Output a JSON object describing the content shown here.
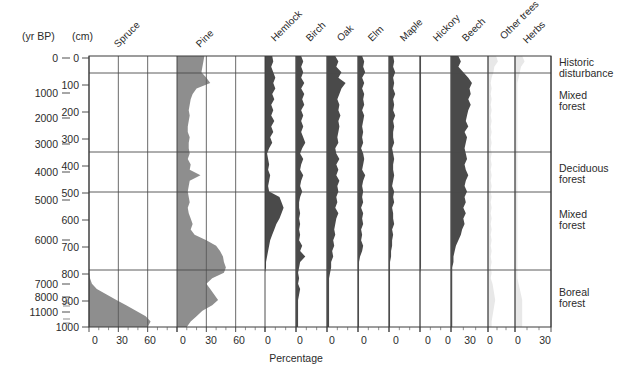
{
  "figure": {
    "axis_unit_labels": {
      "left": "(yr BP)",
      "depth": "(cm)"
    },
    "x_axis_title": "Percentage",
    "colors": {
      "curve_dark": "#4a4a4a",
      "curve_mid": "#8e8e8e",
      "curve_light": "#e8e8e8",
      "axis": "#3a3a3a",
      "zone_line": "#4a4a4a",
      "background": "#ffffff"
    },
    "plot_box": {
      "left": 89,
      "right": 551,
      "top": 56,
      "bottom": 327
    }
  },
  "age_axis": {
    "label": "(yr BP)",
    "ticks": [
      {
        "value": "0",
        "y": 58
      },
      {
        "value": "1000",
        "y": 93
      },
      {
        "value": "2000",
        "y": 118
      },
      {
        "value": "3000",
        "y": 144
      },
      {
        "value": "4000",
        "y": 172
      },
      {
        "value": "5000",
        "y": 200
      },
      {
        "value": "6000",
        "y": 240
      },
      {
        "value": "7000",
        "y": 284
      },
      {
        "value": "8000",
        "y": 297
      },
      {
        "value": "11000",
        "y": 312
      }
    ],
    "minor_ticks_y": [
      303,
      306,
      319,
      323
    ]
  },
  "depth_axis": {
    "label": "(cm)",
    "ticks": [
      {
        "value": "0",
        "y": 58
      },
      {
        "value": "100",
        "y": 85
      },
      {
        "value": "200",
        "y": 112
      },
      {
        "value": "300",
        "y": 139
      },
      {
        "value": "400",
        "y": 166
      },
      {
        "value": "500",
        "y": 193
      },
      {
        "value": "600",
        "y": 220
      },
      {
        "value": "700",
        "y": 247
      },
      {
        "value": "800",
        "y": 274
      },
      {
        "value": "900",
        "y": 301
      },
      {
        "value": "1000",
        "y": 327
      }
    ],
    "range_cm": [
      0,
      1000
    ]
  },
  "zones": [
    {
      "label_line1": "Historic",
      "label_line2": "disturbance",
      "top_y": 56,
      "bottom_y": 73,
      "depth_top_cm": 0,
      "depth_bottom_cm": 63
    },
    {
      "label_line1": "Mixed",
      "label_line2": "forest",
      "top_y": 73,
      "bottom_y": 152,
      "depth_top_cm": 63,
      "depth_bottom_cm": 353
    },
    {
      "label_line1": "Deciduous",
      "label_line2": "forest",
      "top_y": 152,
      "bottom_y": 192,
      "depth_top_cm": 353,
      "depth_bottom_cm": 500
    },
    {
      "label_line1": "Mixed",
      "label_line2": "forest",
      "top_y": 192,
      "bottom_y": 270,
      "depth_top_cm": 500,
      "depth_bottom_cm": 790
    },
    {
      "label_line1": "Boreal",
      "label_line2": "forest",
      "top_y": 270,
      "bottom_y": 327,
      "depth_top_cm": 790,
      "depth_bottom_cm": 1000
    }
  ],
  "taxa": [
    {
      "name": "Spruce",
      "x_ticks": [
        "0",
        "30",
        "60"
      ],
      "max_pct": 90,
      "shade": "mid",
      "label_x": 118,
      "label_y": 48
    },
    {
      "name": "Pine",
      "x_ticks": [
        "0",
        "30",
        "60"
      ],
      "max_pct": 90,
      "shade": "mid",
      "label_x": 200,
      "label_y": 48
    },
    {
      "name": "Hemlock",
      "x_ticks": [
        "0"
      ],
      "max_pct": 30,
      "shade": "dark",
      "label_x": 275,
      "label_y": 42
    },
    {
      "name": "Birch",
      "x_ticks": [
        "0"
      ],
      "max_pct": 30,
      "shade": "dark",
      "label_x": 310,
      "label_y": 42
    },
    {
      "name": "Oak",
      "x_ticks": [
        "0"
      ],
      "max_pct": 30,
      "shade": "dark",
      "label_x": 341,
      "label_y": 42
    },
    {
      "name": "Elm",
      "x_ticks": [
        "0"
      ],
      "max_pct": 30,
      "shade": "dark",
      "label_x": 372,
      "label_y": 42
    },
    {
      "name": "Maple",
      "x_ticks": [
        "0"
      ],
      "max_pct": 30,
      "shade": "dark",
      "label_x": 404,
      "label_y": 42
    },
    {
      "name": "Hickory",
      "x_ticks": [
        "0"
      ],
      "max_pct": 30,
      "shade": "dark",
      "label_x": 437,
      "label_y": 42
    },
    {
      "name": "Beech",
      "x_ticks": [
        "0",
        "30"
      ],
      "max_pct": 30,
      "shade": "dark",
      "label_x": 466,
      "label_y": 42
    },
    {
      "name": "Other trees",
      "x_ticks": [
        "0"
      ],
      "max_pct": 30,
      "shade": "light",
      "label_x": 504,
      "label_y": 40
    },
    {
      "name": "Herbs",
      "x_ticks": [
        "0",
        "30"
      ],
      "max_pct": 30,
      "shade": "light",
      "label_x": 527,
      "label_y": 44
    }
  ],
  "chart_data": {
    "type": "area",
    "xlabel": "Percentage",
    "ylabel": "(cm)",
    "secondary_ylabel": "(yr BP)",
    "ylim_depth_cm": [
      0,
      1000
    ],
    "y_inverted": true,
    "grid": "zone-boundaries-only",
    "legend": "none (taxon names as rotated column headers)",
    "annotations": [
      "Historic disturbance",
      "Mixed forest",
      "Deciduous forest",
      "Mixed forest",
      "Boreal forest"
    ],
    "depths_cm": [
      0,
      20,
      40,
      60,
      80,
      100,
      120,
      140,
      160,
      180,
      200,
      220,
      240,
      260,
      280,
      300,
      320,
      340,
      360,
      380,
      400,
      420,
      440,
      460,
      480,
      500,
      520,
      540,
      560,
      580,
      600,
      620,
      640,
      660,
      680,
      700,
      720,
      740,
      760,
      780,
      800,
      820,
      840,
      860,
      880,
      900,
      920,
      940,
      960,
      980,
      1000
    ],
    "series": [
      {
        "name": "Spruce",
        "xmax_pct": 90,
        "shade": "mid",
        "values": [
          0,
          0,
          0,
          0,
          0,
          0,
          0,
          0,
          0,
          0,
          0,
          0,
          0,
          0,
          0,
          0,
          0,
          0,
          0,
          0,
          0,
          0,
          0,
          0,
          0,
          0,
          0,
          0,
          0,
          0,
          0,
          0,
          0,
          0,
          0,
          0,
          0,
          0,
          0,
          0,
          0,
          1,
          3,
          8,
          18,
          28,
          38,
          48,
          58,
          63,
          60
        ]
      },
      {
        "name": "Pine",
        "xmax_pct": 90,
        "shade": "mid",
        "values": [
          28,
          27,
          26,
          25,
          30,
          34,
          20,
          16,
          14,
          13,
          12,
          13,
          12,
          11,
          11,
          13,
          12,
          12,
          13,
          11,
          14,
          13,
          24,
          13,
          12,
          11,
          12,
          13,
          11,
          12,
          14,
          16,
          14,
          18,
          30,
          40,
          44,
          47,
          48,
          50,
          48,
          36,
          30,
          34,
          38,
          42,
          36,
          26,
          20,
          14,
          10
        ]
      },
      {
        "name": "Hemlock",
        "xmax_pct": 30,
        "shade": "dark",
        "values": [
          7,
          8,
          6,
          8,
          10,
          8,
          10,
          7,
          9,
          6,
          8,
          6,
          9,
          6,
          8,
          5,
          7,
          4,
          2,
          3,
          4,
          3,
          5,
          4,
          3,
          4,
          14,
          16,
          18,
          16,
          14,
          11,
          9,
          7,
          5,
          4,
          3,
          2,
          1,
          1,
          0,
          0,
          0,
          0,
          0,
          0,
          0,
          0,
          0,
          0,
          0
        ]
      },
      {
        "name": "Birch",
        "xmax_pct": 30,
        "shade": "dark",
        "values": [
          5,
          7,
          5,
          7,
          5,
          8,
          5,
          8,
          6,
          8,
          5,
          7,
          5,
          7,
          5,
          7,
          9,
          6,
          4,
          7,
          5,
          4,
          7,
          5,
          4,
          6,
          4,
          3,
          3,
          4,
          3,
          4,
          3,
          4,
          3,
          6,
          4,
          9,
          4,
          3,
          2,
          3,
          2,
          4,
          3,
          2,
          2,
          2,
          2,
          2,
          2
        ]
      },
      {
        "name": "Oak",
        "xmax_pct": 30,
        "shade": "dark",
        "values": [
          8,
          11,
          9,
          14,
          11,
          18,
          14,
          12,
          10,
          12,
          11,
          13,
          11,
          12,
          11,
          10,
          11,
          8,
          9,
          12,
          9,
          11,
          9,
          12,
          10,
          11,
          9,
          10,
          8,
          11,
          9,
          8,
          7,
          8,
          6,
          7,
          5,
          6,
          4,
          4,
          3,
          2,
          2,
          2,
          2,
          2,
          2,
          2,
          2,
          2,
          2
        ]
      },
      {
        "name": "Elm",
        "xmax_pct": 30,
        "shade": "dark",
        "values": [
          4,
          6,
          5,
          7,
          4,
          6,
          4,
          6,
          5,
          6,
          4,
          6,
          5,
          4,
          5,
          4,
          5,
          3,
          5,
          6,
          5,
          4,
          7,
          5,
          4,
          5,
          4,
          5,
          3,
          5,
          4,
          5,
          3,
          4,
          3,
          5,
          4,
          2,
          1,
          1,
          1,
          1,
          1,
          1,
          1,
          1,
          1,
          1,
          1,
          1,
          1
        ]
      },
      {
        "name": "Maple",
        "xmax_pct": 30,
        "shade": "dark",
        "values": [
          4,
          5,
          4,
          6,
          4,
          5,
          4,
          6,
          4,
          5,
          4,
          6,
          4,
          5,
          4,
          4,
          5,
          3,
          4,
          5,
          4,
          4,
          5,
          4,
          3,
          5,
          4,
          5,
          3,
          4,
          4,
          5,
          3,
          4,
          3,
          3,
          2,
          2,
          1,
          1,
          1,
          1,
          1,
          1,
          1,
          1,
          1,
          1,
          1,
          1,
          1
        ]
      },
      {
        "name": "Hickory",
        "xmax_pct": 30,
        "shade": "dark",
        "values": [
          1,
          1,
          1,
          1,
          1,
          1,
          1,
          1,
          1,
          1,
          1,
          1,
          1,
          1,
          1,
          1,
          1,
          1,
          1,
          1,
          1,
          1,
          1,
          1,
          1,
          1,
          1,
          1,
          1,
          1,
          1,
          1,
          1,
          1,
          1,
          1,
          1,
          1,
          1,
          1,
          0,
          0,
          0,
          0,
          0,
          0,
          0,
          0,
          0,
          0,
          0
        ]
      },
      {
        "name": "Beech",
        "xmax_pct": 30,
        "shade": "dark",
        "values": [
          6,
          8,
          6,
          10,
          14,
          17,
          15,
          16,
          14,
          16,
          14,
          13,
          12,
          14,
          11,
          13,
          12,
          11,
          12,
          13,
          11,
          12,
          14,
          12,
          11,
          13,
          11,
          12,
          10,
          12,
          10,
          11,
          9,
          8,
          6,
          4,
          3,
          2,
          2,
          1,
          1,
          1,
          1,
          1,
          1,
          1,
          1,
          1,
          1,
          1,
          1
        ]
      },
      {
        "name": "Other trees",
        "xmax_pct": 30,
        "shade": "light",
        "values": [
          9,
          11,
          7,
          6,
          4,
          3,
          4,
          3,
          4,
          3,
          4,
          3,
          4,
          3,
          4,
          3,
          4,
          3,
          4,
          3,
          4,
          3,
          4,
          3,
          4,
          3,
          4,
          3,
          4,
          3,
          4,
          3,
          4,
          3,
          4,
          3,
          4,
          3,
          4,
          3,
          4,
          3,
          5,
          6,
          7,
          8,
          7,
          6,
          5,
          4,
          4
        ]
      },
      {
        "name": "Herbs",
        "xmax_pct": 30,
        "shade": "light",
        "values": [
          6,
          8,
          5,
          4,
          3,
          2,
          2,
          2,
          2,
          2,
          2,
          2,
          2,
          2,
          2,
          2,
          2,
          2,
          2,
          2,
          2,
          2,
          2,
          2,
          2,
          2,
          2,
          2,
          2,
          2,
          2,
          2,
          2,
          2,
          2,
          2,
          2,
          2,
          2,
          2,
          2,
          2,
          3,
          4,
          5,
          6,
          6,
          6,
          6,
          6,
          6
        ]
      }
    ]
  },
  "x_axis_tick_labels": [
    {
      "text": "0",
      "x": 95
    },
    {
      "text": "30",
      "x": 122
    },
    {
      "text": "60",
      "x": 150
    },
    {
      "text": "0",
      "x": 183
    },
    {
      "text": "30",
      "x": 211
    },
    {
      "text": "60",
      "x": 239
    },
    {
      "text": "0",
      "x": 268
    },
    {
      "text": "0",
      "x": 300
    },
    {
      "text": "0",
      "x": 332
    },
    {
      "text": "0",
      "x": 364
    },
    {
      "text": "0",
      "x": 396
    },
    {
      "text": "0",
      "x": 428
    },
    {
      "text": "0",
      "x": 448
    },
    {
      "text": "30",
      "x": 470
    },
    {
      "text": "0",
      "x": 490
    },
    {
      "text": "0",
      "x": 518
    },
    {
      "text": "30",
      "x": 545
    }
  ]
}
